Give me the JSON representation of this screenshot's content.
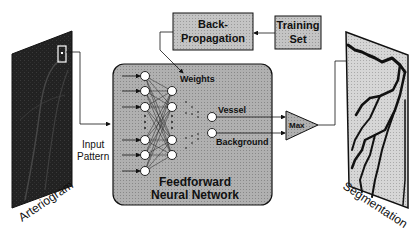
{
  "diagram": {
    "arteriogram": {
      "label": "Arteriogram"
    },
    "input": {
      "line1": "Input",
      "line2": "Pattern"
    },
    "backprop": {
      "line1": "Back-",
      "line2": "Propagation"
    },
    "training": {
      "line1": "Training",
      "line2": "Set"
    },
    "network": {
      "weights_label": "Weights",
      "output_vessel": "Vessel",
      "output_background": "Background",
      "title_line1": "Feedforward",
      "title_line2": "Neural Network"
    },
    "max": {
      "label": "Max"
    },
    "segmentation": {
      "label": "Segmentation"
    },
    "colors": {
      "box_fill": "#c8c8c8",
      "network_fill": "#b4b4b4",
      "image_dark": "#1e1e1e",
      "line": "#111111"
    }
  }
}
